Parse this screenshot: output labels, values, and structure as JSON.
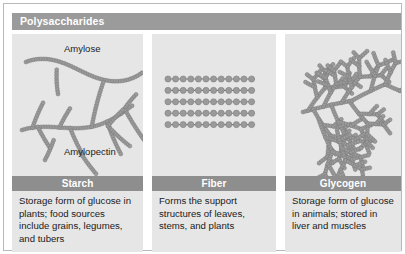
{
  "figure": {
    "title": "Polysaccharides",
    "border_color": "#b9b9b9",
    "header_color": "#9b9b9b",
    "label_bar_color": "#8e8e8e",
    "panel_background": "#e6e6e6",
    "molecule_color": "#9a9a9a",
    "molecule_outline": "#7a7a7a"
  },
  "panels": [
    {
      "id": "starch",
      "label": "Starch",
      "description": "Storage form of glucose in plants; food sources include grains, legumes, and tubers",
      "diagram_type": "branched-and-linear-chains",
      "chain_labels": [
        "Amylose",
        "Amylopectin"
      ]
    },
    {
      "id": "fiber",
      "label": "Fiber",
      "description": "Forms the support structures of leaves, stems, and plants",
      "diagram_type": "lattice-grid",
      "chain_labels": [],
      "lattice_rows": 5,
      "lattice_columns": 12
    },
    {
      "id": "glycogen",
      "label": "Glycogen",
      "description": "Storage form of glucose in animals; stored in liver and muscles",
      "diagram_type": "highly-branched-tree",
      "chain_labels": []
    }
  ]
}
